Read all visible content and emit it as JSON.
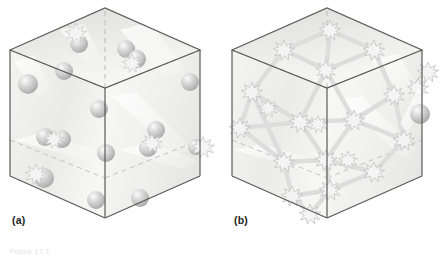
{
  "figure": {
    "kind": "two-panel-isometric-cube-diagram",
    "background": "#ffffff",
    "panels": [
      {
        "id": "a",
        "label": "(a)",
        "description": "Transparent cube containing discrete spheres (particles) with a few starburst collision marks",
        "sphere_count": 16,
        "starburst_count": 5,
        "has_bond_network": false
      },
      {
        "id": "b",
        "label": "(b)",
        "description": "Transparent cube containing starbursts joined by a network of bonds, plus one free sphere at the right",
        "sphere_count": 1,
        "starburst_count": 21,
        "has_bond_network": true
      }
    ],
    "caption": "Figure 17.1",
    "colors": {
      "cube_edge": "#4d4d4d",
      "cube_hidden_edge": "#b3b3b3",
      "face_top": "#e9e9e9",
      "face_left": "#efefef",
      "face_right": "#f4f4f4",
      "sphere_fill": "#c8c8c8",
      "sphere_highlight": "#f2f2f2",
      "starburst_fill": "#f0f0f0",
      "starburst_stroke": "#c4c4c4",
      "bond": "#dedede",
      "label_text": "#231f20"
    },
    "geometry": {
      "top_vertex": [
        105,
        8
      ],
      "left_vertex": [
        10,
        50
      ],
      "right_vertex": [
        200,
        50
      ],
      "center_vertex": [
        105,
        88
      ],
      "bottom_left": [
        10,
        176
      ],
      "bottom_right": [
        200,
        176
      ],
      "bottom_vertex": [
        105,
        218
      ]
    }
  }
}
